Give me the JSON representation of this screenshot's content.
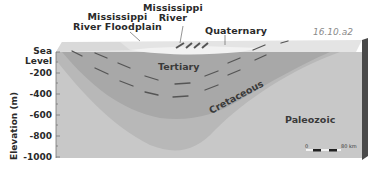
{
  "figure": {
    "id_label": "16.10.a2"
  },
  "labels": {
    "floodplain_line1": "Mississippi",
    "floodplain_line2": "River Floodplain",
    "river_line1": "Mississippi",
    "river_line2": "River",
    "quaternary": "Quaternary",
    "tertiary": "Tertiary",
    "cretaceous": "Cretaceous",
    "paleozoic": "Paleozoic"
  },
  "y_axis": {
    "title": "Elevation (m)",
    "ticks": [
      "Sea Level",
      "-200",
      "-400",
      "-600",
      "-800",
      "-1000"
    ]
  },
  "scale_bar": {
    "start": "0",
    "end": "80 km"
  },
  "colors": {
    "paleozoic": "#c9c9c9",
    "cretaceous": "#b9b9b9",
    "tertiary": "#a9a9a9",
    "surface": "#e6e6e6",
    "side_face": "#4a4a4a",
    "dash": "#555555"
  }
}
